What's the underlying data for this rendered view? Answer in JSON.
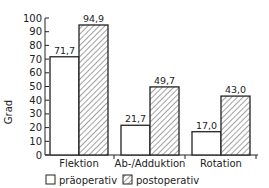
{
  "chart_data": {
    "type": "bar",
    "title": "",
    "xlabel": "",
    "ylabel": "Grad",
    "ylim": [
      0,
      100
    ],
    "yticks": [
      0,
      10,
      20,
      30,
      40,
      50,
      60,
      70,
      80,
      90,
      100
    ],
    "categories": [
      "Flektion",
      "Ab-/Adduktion",
      "Rotation"
    ],
    "series": [
      {
        "name": "präoperativ",
        "values": [
          71.7,
          21.7,
          17.0
        ],
        "labels": [
          "71,7",
          "21,7",
          "17,0"
        ],
        "fill": "white"
      },
      {
        "name": "postoperativ",
        "values": [
          94.9,
          49.7,
          43.0
        ],
        "labels": [
          "94,9",
          "49,7",
          "43,0"
        ],
        "fill": "hatched"
      }
    ],
    "grid": false,
    "legend_position": "bottom"
  },
  "legend": {
    "pre": "präoperativ",
    "post": "postoperativ"
  }
}
